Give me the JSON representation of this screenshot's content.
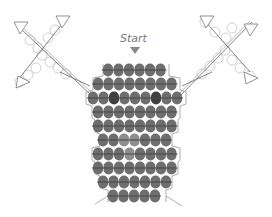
{
  "diagram": {
    "start_label": "Start",
    "colors": {
      "bead": "#6e6e6e",
      "bead_dark": "#3f3f3f",
      "bead_light": "#8e8e8e",
      "thread": "#444444",
      "outline": "#999999",
      "ghost_bead": "#bbbbbb"
    },
    "rows": [
      {
        "y": 70,
        "count": 6,
        "x0": 108,
        "accents": []
      },
      {
        "y": 84,
        "count": 8,
        "x0": 98,
        "accents": []
      },
      {
        "y": 98,
        "count": 9,
        "x0": 93,
        "accents": [
          {
            "i": 2,
            "tone": "dark"
          },
          {
            "i": 6,
            "tone": "dark"
          }
        ]
      },
      {
        "y": 112,
        "count": 8,
        "x0": 98,
        "accents": []
      },
      {
        "y": 126,
        "count": 8,
        "x0": 98,
        "accents": []
      },
      {
        "y": 140,
        "count": 7,
        "x0": 103,
        "accents": [
          {
            "i": 2,
            "tone": "light"
          },
          {
            "i": 3,
            "tone": "light"
          }
        ]
      },
      {
        "y": 154,
        "count": 8,
        "x0": 98,
        "accents": [
          {
            "i": 3,
            "tone": "light"
          }
        ]
      },
      {
        "y": 168,
        "count": 8,
        "x0": 98,
        "accents": []
      },
      {
        "y": 182,
        "count": 7,
        "x0": 103,
        "accents": []
      },
      {
        "y": 196,
        "count": 5,
        "x0": 113,
        "accents": []
      }
    ],
    "bead_spacing": 10.5,
    "bead_radius": 5.5
  }
}
